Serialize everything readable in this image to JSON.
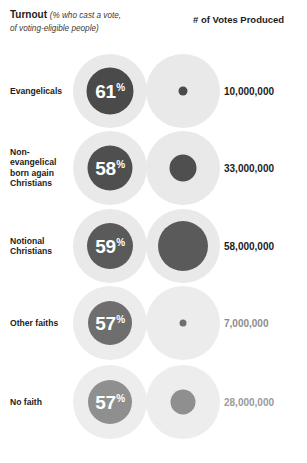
{
  "header": {
    "turnout_title": "Turnout",
    "turnout_note_line1": "(% who cast a vote,",
    "turnout_note_line2": "of voting-eligible people)",
    "votes_title": "# of Votes Produced"
  },
  "chart_data": {
    "type": "bar",
    "xlabel": "",
    "ylabel": "",
    "categories": [
      "Evangelicals",
      "Non-evangelical born again Christians",
      "Notional Christians",
      "Other faiths",
      "No faith"
    ],
    "series": [
      {
        "name": "Turnout (%)",
        "values": [
          61,
          58,
          59,
          57,
          57
        ],
        "unit": "%"
      },
      {
        "name": "# of Votes Produced",
        "values": [
          10000000,
          33000000,
          58000000,
          7000000,
          28000000
        ],
        "unit": "votes"
      }
    ],
    "legend_position": "top",
    "grid": false
  },
  "rows": [
    {
      "label": "Evangelicals",
      "percent": "61",
      "percent_sign": "%",
      "votes_label": "10,000,000",
      "pct_circle_size": 47,
      "votes_circle_size": 9,
      "dark_color": "#4a4a4a",
      "pale_color": "#e9e9e9",
      "votes_number_color": "#1c1c1c"
    },
    {
      "label": "Non-\nevangelical\nborn again\nChristians",
      "percent": "58",
      "percent_sign": "%",
      "votes_label": "33,000,000",
      "pct_circle_size": 45,
      "votes_circle_size": 27,
      "dark_color": "#4f4f4f",
      "pale_color": "#e9e9e9",
      "votes_number_color": "#1c1c1c"
    },
    {
      "label": "Notional\nChristians",
      "percent": "59",
      "percent_sign": "%",
      "votes_label": "58,000,000",
      "pct_circle_size": 46,
      "votes_circle_size": 50,
      "dark_color": "#5a5a5a",
      "pale_color": "#e9e9e9",
      "votes_number_color": "#1c1c1c"
    },
    {
      "label": "Other faiths",
      "percent": "57",
      "percent_sign": "%",
      "votes_label": "7,000,000",
      "pct_circle_size": 44,
      "votes_circle_size": 7,
      "dark_color": "#6e6e6e",
      "pale_color": "#ececec",
      "votes_number_color": "#8c8c8c"
    },
    {
      "label": "No faith",
      "percent": "57",
      "percent_sign": "%",
      "votes_label": "28,000,000",
      "pct_circle_size": 44,
      "votes_circle_size": 25,
      "dark_color": "#8f8f8f",
      "pale_color": "#ededed",
      "votes_number_color": "#9a9a9a"
    }
  ],
  "colors": {
    "pale": "#e9e9e9",
    "text_dark": "#1c1c1c",
    "text_muted": "#9a9a9a"
  }
}
